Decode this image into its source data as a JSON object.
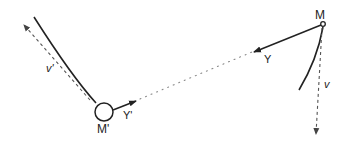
{
  "diagram": {
    "type": "physics-vector-diagram",
    "labels": {
      "body_M": "M",
      "body_M_prime": "M'",
      "force_Y": "Y",
      "force_Y_prime": "Y'",
      "velocity_v": "v",
      "velocity_v_prime": "v'"
    },
    "colors": {
      "line": "#222222",
      "dashed": "#444444",
      "dotted": "#888888",
      "background": "#ffffff"
    }
  }
}
